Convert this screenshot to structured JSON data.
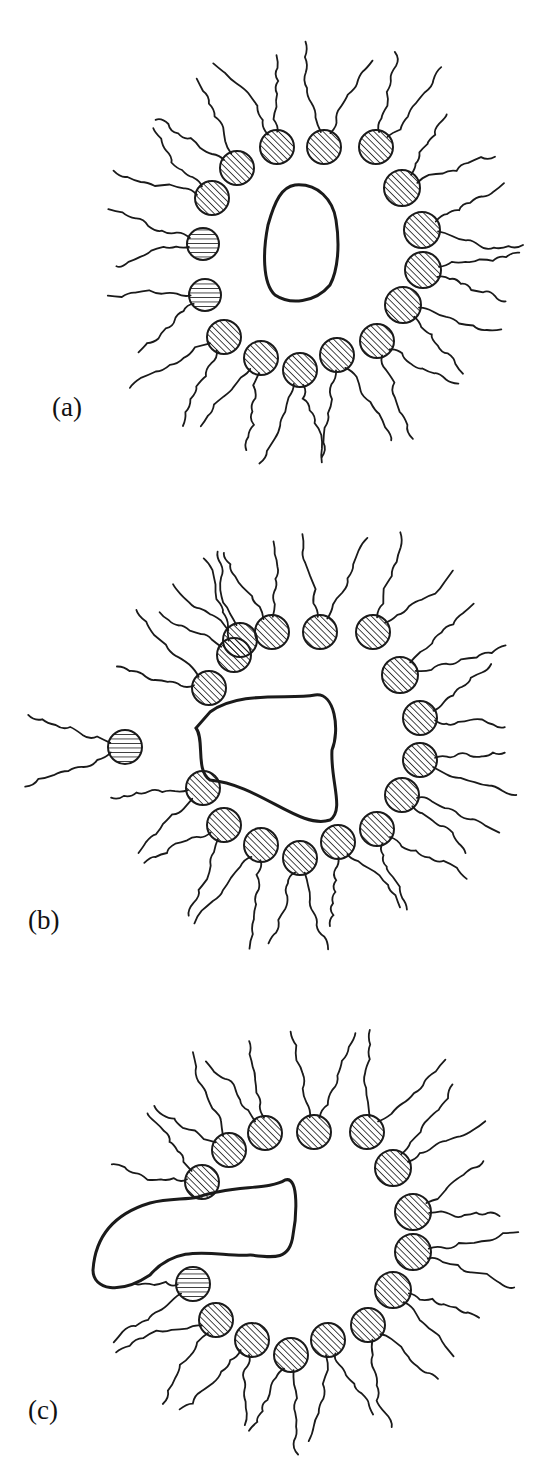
{
  "figure": {
    "stroke_color": "#1a1a1a",
    "background": "#ffffff",
    "panels": [
      {
        "id": "a",
        "label": "(a)",
        "top": 0,
        "height": 470,
        "label_pos": [
          52,
          392
        ],
        "core": "M295,20 C318,18 333,35 336,55 C340,80 338,105 330,120 C315,138 290,140 275,130 C262,118 263,85 268,60 C275,35 282,22 295,20 Z",
        "core_offset": [
          0,
          165
        ],
        "heads": [
          {
            "x": 277,
            "y": 147,
            "r": 17,
            "hatch": "diag"
          },
          {
            "x": 324,
            "y": 147,
            "r": 17,
            "hatch": "diag"
          },
          {
            "x": 376,
            "y": 147,
            "r": 17,
            "hatch": "diag"
          },
          {
            "x": 237,
            "y": 168,
            "r": 17,
            "hatch": "diag"
          },
          {
            "x": 212,
            "y": 198,
            "r": 17,
            "hatch": "diag"
          },
          {
            "x": 203,
            "y": 244,
            "r": 16,
            "hatch": "horiz"
          },
          {
            "x": 205,
            "y": 295,
            "r": 16,
            "hatch": "horiz"
          },
          {
            "x": 224,
            "y": 337,
            "r": 17,
            "hatch": "diag"
          },
          {
            "x": 261,
            "y": 358,
            "r": 17,
            "hatch": "diag"
          },
          {
            "x": 300,
            "y": 370,
            "r": 17,
            "hatch": "diag"
          },
          {
            "x": 337,
            "y": 355,
            "r": 17,
            "hatch": "diag"
          },
          {
            "x": 377,
            "y": 341,
            "r": 17,
            "hatch": "diag"
          },
          {
            "x": 403,
            "y": 305,
            "r": 18,
            "hatch": "diag"
          },
          {
            "x": 423,
            "y": 270,
            "r": 18,
            "hatch": "diag"
          },
          {
            "x": 422,
            "y": 230,
            "r": 18,
            "hatch": "diag"
          },
          {
            "x": 402,
            "y": 188,
            "r": 18,
            "hatch": "diag"
          }
        ]
      },
      {
        "id": "b",
        "label": "(b)",
        "top": 500,
        "height": 470,
        "label_pos": [
          28,
          405
        ],
        "core": "M210,212 C240,190 290,200 315,195 C335,192 340,230 332,250 C330,280 345,310 330,320 C300,330 260,285 210,280 C195,270 205,240 196,228 Z",
        "core_offset": [
          0,
          0
        ],
        "heads": [
          {
            "x": 240,
            "y": 140,
            "r": 17,
            "hatch": "diag"
          },
          {
            "x": 272,
            "y": 132,
            "r": 17,
            "hatch": "diag"
          },
          {
            "x": 320,
            "y": 132,
            "r": 17,
            "hatch": "diag"
          },
          {
            "x": 373,
            "y": 132,
            "r": 17,
            "hatch": "diag"
          },
          {
            "x": 234,
            "y": 155,
            "r": 17,
            "hatch": "diag"
          },
          {
            "x": 209,
            "y": 188,
            "r": 17,
            "hatch": "diag"
          },
          {
            "x": 125,
            "y": 247,
            "r": 17,
            "hatch": "horiz"
          },
          {
            "x": 203,
            "y": 288,
            "r": 17,
            "hatch": "diag"
          },
          {
            "x": 224,
            "y": 325,
            "r": 17,
            "hatch": "diag"
          },
          {
            "x": 261,
            "y": 345,
            "r": 17,
            "hatch": "diag"
          },
          {
            "x": 300,
            "y": 358,
            "r": 17,
            "hatch": "diag"
          },
          {
            "x": 338,
            "y": 342,
            "r": 17,
            "hatch": "diag"
          },
          {
            "x": 377,
            "y": 329,
            "r": 17,
            "hatch": "diag"
          },
          {
            "x": 402,
            "y": 295,
            "r": 17,
            "hatch": "diag"
          },
          {
            "x": 420,
            "y": 260,
            "r": 17,
            "hatch": "diag"
          },
          {
            "x": 420,
            "y": 218,
            "r": 17,
            "hatch": "diag"
          },
          {
            "x": 400,
            "y": 175,
            "r": 18,
            "hatch": "diag"
          }
        ]
      },
      {
        "id": "c",
        "label": "(c)",
        "top": 990,
        "height": 493,
        "label_pos": [
          28,
          405
        ],
        "core": "M198,207 C230,195 270,200 285,190 C300,185 296,230 293,245 C290,270 275,268 250,265 C220,268 180,250 150,285 C120,305 93,300 93,280 C95,250 110,225 150,213 C170,208 185,210 198,207 Z",
        "core_offset": [
          0,
          0
        ],
        "heads": [
          {
            "x": 265,
            "y": 143,
            "r": 17,
            "hatch": "diag"
          },
          {
            "x": 314,
            "y": 142,
            "r": 17,
            "hatch": "diag"
          },
          {
            "x": 367,
            "y": 142,
            "r": 17,
            "hatch": "diag"
          },
          {
            "x": 229,
            "y": 160,
            "r": 17,
            "hatch": "diag"
          },
          {
            "x": 202,
            "y": 192,
            "r": 17,
            "hatch": "diag"
          },
          {
            "x": 193,
            "y": 294,
            "r": 17,
            "hatch": "vert"
          },
          {
            "x": 216,
            "y": 330,
            "r": 17,
            "hatch": "diag"
          },
          {
            "x": 252,
            "y": 350,
            "r": 17,
            "hatch": "diag"
          },
          {
            "x": 291,
            "y": 365,
            "r": 17,
            "hatch": "diag"
          },
          {
            "x": 328,
            "y": 350,
            "r": 17,
            "hatch": "diag"
          },
          {
            "x": 368,
            "y": 335,
            "r": 17,
            "hatch": "diag"
          },
          {
            "x": 393,
            "y": 300,
            "r": 18,
            "hatch": "diag"
          },
          {
            "x": 413,
            "y": 262,
            "r": 18,
            "hatch": "diag"
          },
          {
            "x": 413,
            "y": 222,
            "r": 18,
            "hatch": "diag"
          },
          {
            "x": 393,
            "y": 178,
            "r": 18,
            "hatch": "diag"
          }
        ]
      }
    ]
  }
}
